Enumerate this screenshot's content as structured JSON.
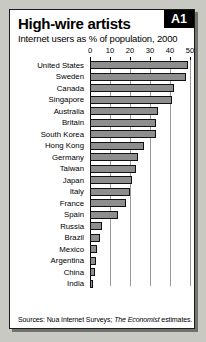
{
  "figure": {
    "title": "High-wire artists",
    "subtitle": "Internet users as % of population, 2000",
    "badge": "A1",
    "sources_prefix": "Sources: Nua Internet Surveys; ",
    "sources_italic": "The Economist",
    "sources_suffix": " estimates."
  },
  "chart_data": {
    "type": "bar",
    "orientation": "horizontal",
    "title": "High-wire artists",
    "subtitle": "Internet users as % of population, 2000",
    "xlabel": "",
    "ylabel": "",
    "xlim": [
      0,
      50
    ],
    "xticks": [
      0,
      10,
      20,
      30,
      40,
      50
    ],
    "xtick_labels": [
      "0",
      "10",
      "20",
      "30",
      "40",
      "50"
    ],
    "grid": true,
    "legend": false,
    "categories": [
      "United States",
      "Sweden",
      "Canada",
      "Singapore",
      "Australia",
      "Britain",
      "South Korea",
      "Hong Kong",
      "Germany",
      "Taiwan",
      "Japan",
      "Italy",
      "France",
      "Spain",
      "Russia",
      "Brazil",
      "Mexico",
      "Argentina",
      "China",
      "India"
    ],
    "values": [
      49,
      48,
      42,
      41,
      34,
      33,
      33,
      27,
      24,
      23,
      21,
      20,
      18,
      14,
      6,
      5,
      3.5,
      3,
      2.5,
      1
    ],
    "series": [
      {
        "name": "Internet users as % of population, 2000",
        "values": [
          49,
          48,
          42,
          41,
          34,
          33,
          33,
          27,
          24,
          23,
          21,
          20,
          18,
          14,
          6,
          5,
          3.5,
          3,
          2.5,
          1
        ]
      }
    ],
    "bar_color": "#8e8e8e",
    "bar_edge_color": "#111111"
  }
}
